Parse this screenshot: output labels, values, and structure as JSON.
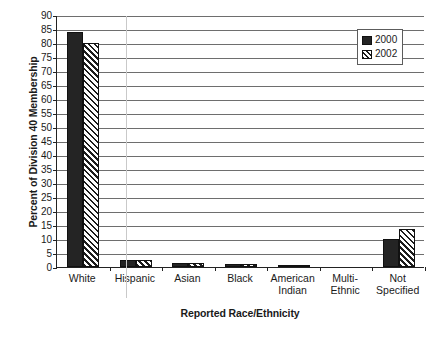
{
  "chart_data": {
    "type": "bar",
    "title": "",
    "xlabel": "Reported Race/Ethnicity",
    "ylabel": "Percent of Division 40 Membership",
    "categories": [
      "White",
      "Hispanic",
      "Asian",
      "Black",
      "American\nIndian",
      "Multi-\nEthnic",
      "Not\nSpecified"
    ],
    "series": [
      {
        "name": "2000",
        "values": [
          84,
          2.5,
          1.5,
          1,
          0.3,
          0,
          10
        ]
      },
      {
        "name": "2002",
        "values": [
          80,
          2.5,
          1.5,
          1,
          0.3,
          0,
          13.5
        ]
      }
    ],
    "ylim": [
      0,
      90
    ],
    "ytick_labels": [
      "0",
      "5",
      "10",
      "15",
      "20",
      "25",
      "30",
      "35",
      "40",
      "45",
      "50",
      "55",
      "60",
      "65",
      "70",
      "75",
      "80",
      "85",
      "90"
    ],
    "ytick_values": [
      0,
      5,
      10,
      15,
      20,
      25,
      30,
      35,
      40,
      45,
      50,
      55,
      60,
      65,
      70,
      75,
      80,
      85,
      90
    ],
    "grid": true,
    "legend_position": "top-right",
    "legend_entries": [
      "2000",
      "2002"
    ],
    "colors": {
      "series_2000": "#242424",
      "series_2002": "#ffffff",
      "axis": "#222222",
      "grid": "#6e6e6e"
    }
  }
}
